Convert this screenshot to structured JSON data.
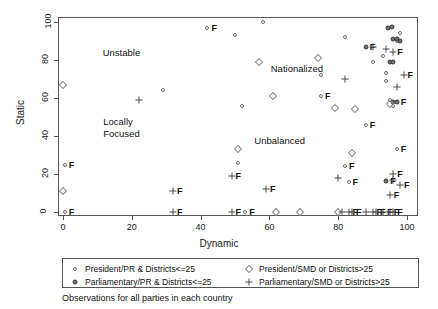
{
  "chart_data": {
    "type": "scatter",
    "title": "",
    "xlabel": "Dynamic",
    "ylabel": "Static",
    "xlim": [
      0,
      100
    ],
    "ylim": [
      0,
      100
    ],
    "xticks": [
      0,
      20,
      40,
      60,
      80,
      100
    ],
    "yticks": [
      0,
      20,
      40,
      60,
      80,
      100
    ],
    "grid": false,
    "caption": "Observations for all parties in each country",
    "legend_position": "below-axes",
    "annotations": [
      {
        "text": "Unstable",
        "x": 17,
        "y": 84
      },
      {
        "text": "Locally\nFocused",
        "x": 17,
        "y": 44
      },
      {
        "text": "Nationalized",
        "x": 68,
        "y": 76
      },
      {
        "text": "Unbalanced",
        "x": 63,
        "y": 38
      }
    ],
    "series": [
      {
        "name": "President/PR &  Districts<=25",
        "marker": "open-circle",
        "points": [
          {
            "x": 0.5,
            "y": 25,
            "label": "F"
          },
          {
            "x": 0.5,
            "y": 0,
            "label": "F"
          },
          {
            "x": 29,
            "y": 64,
            "label": ""
          },
          {
            "x": 42,
            "y": 97,
            "label": "F"
          },
          {
            "x": 50,
            "y": 93,
            "label": ""
          },
          {
            "x": 52,
            "y": 56,
            "label": ""
          },
          {
            "x": 51,
            "y": 26,
            "label": ""
          },
          {
            "x": 53,
            "y": 0,
            "label": "F"
          },
          {
            "x": 58,
            "y": 100,
            "label": ""
          },
          {
            "x": 75,
            "y": 72,
            "label": ""
          },
          {
            "x": 75,
            "y": 61,
            "label": "F"
          },
          {
            "x": 82,
            "y": 92,
            "label": ""
          },
          {
            "x": 82,
            "y": 24,
            "label": "F"
          },
          {
            "x": 83,
            "y": 16,
            "label": "F"
          },
          {
            "x": 88,
            "y": 46,
            "label": "F"
          },
          {
            "x": 90,
            "y": 79,
            "label": ""
          },
          {
            "x": 93,
            "y": 82,
            "label": ""
          },
          {
            "x": 94,
            "y": 73,
            "label": ""
          },
          {
            "x": 94,
            "y": 69,
            "label": ""
          },
          {
            "x": 95,
            "y": 59,
            "label": ""
          },
          {
            "x": 96,
            "y": 56,
            "label": ""
          },
          {
            "x": 97,
            "y": 33,
            "label": "F"
          },
          {
            "x": 98,
            "y": 94,
            "label": ""
          },
          {
            "x": 97,
            "y": 90,
            "label": ""
          }
        ]
      },
      {
        "name": "Parliamentary/PR & Districts<=25",
        "marker": "filled-circle",
        "points": [
          {
            "x": 88,
            "y": 87,
            "label": "F"
          },
          {
            "x": 94.5,
            "y": 97,
            "label": ""
          },
          {
            "x": 95.5,
            "y": 97.5,
            "label": ""
          },
          {
            "x": 96,
            "y": 91,
            "label": ""
          },
          {
            "x": 97,
            "y": 91,
            "label": ""
          },
          {
            "x": 98,
            "y": 90,
            "label": ""
          },
          {
            "x": 95,
            "y": 79,
            "label": ""
          },
          {
            "x": 96,
            "y": 79,
            "label": ""
          },
          {
            "x": 96,
            "y": 58,
            "label": ""
          },
          {
            "x": 97,
            "y": 58,
            "label": "F"
          },
          {
            "x": 94,
            "y": 16.5,
            "label": "F"
          }
        ]
      },
      {
        "name": "President/SMD or Districts>25",
        "marker": "open-diamond",
        "points": [
          {
            "x": 0,
            "y": 67,
            "label": ""
          },
          {
            "x": 0,
            "y": 11,
            "label": ""
          },
          {
            "x": 51,
            "y": 33,
            "label": ""
          },
          {
            "x": 57,
            "y": 79,
            "label": ""
          },
          {
            "x": 61,
            "y": 61,
            "label": ""
          },
          {
            "x": 62,
            "y": 0,
            "label": ""
          },
          {
            "x": 69,
            "y": 0,
            "label": ""
          },
          {
            "x": 74,
            "y": 81,
            "label": ""
          },
          {
            "x": 79,
            "y": 55,
            "label": ""
          },
          {
            "x": 80,
            "y": 0,
            "label": ""
          },
          {
            "x": 85,
            "y": 54,
            "label": ""
          },
          {
            "x": 84,
            "y": 31,
            "label": ""
          },
          {
            "x": 95,
            "y": 57,
            "label": ""
          }
        ]
      },
      {
        "name": "Parliamentary/SMD or Districts>25",
        "marker": "plus",
        "points": [
          {
            "x": 22,
            "y": 59,
            "label": ""
          },
          {
            "x": 32,
            "y": 11,
            "label": "F"
          },
          {
            "x": 32,
            "y": 0,
            "label": "F"
          },
          {
            "x": 49,
            "y": 19,
            "label": "F"
          },
          {
            "x": 49,
            "y": 0,
            "label": "F"
          },
          {
            "x": 59,
            "y": 12,
            "label": "F"
          },
          {
            "x": 80,
            "y": 18,
            "label": ""
          },
          {
            "x": 81,
            "y": 0,
            "label": ""
          },
          {
            "x": 82,
            "y": 70,
            "label": ""
          },
          {
            "x": 83,
            "y": 0,
            "label": "F"
          },
          {
            "x": 84,
            "y": 0,
            "label": "F"
          },
          {
            "x": 88,
            "y": 0,
            "label": ""
          },
          {
            "x": 90,
            "y": 0,
            "label": "F"
          },
          {
            "x": 91,
            "y": 0,
            "label": "F"
          },
          {
            "x": 93,
            "y": 0,
            "label": "F"
          },
          {
            "x": 95,
            "y": 0,
            "label": "F"
          },
          {
            "x": 96,
            "y": 0,
            "label": "F"
          },
          {
            "x": 95,
            "y": 9,
            "label": "F"
          },
          {
            "x": 96,
            "y": 20,
            "label": "F"
          },
          {
            "x": 98,
            "y": 14,
            "label": "F"
          },
          {
            "x": 96,
            "y": 17,
            "label": ""
          },
          {
            "x": 94,
            "y": 86,
            "label": ""
          },
          {
            "x": 96,
            "y": 84,
            "label": "F"
          },
          {
            "x": 97,
            "y": 66,
            "label": ""
          },
          {
            "x": 99,
            "y": 72,
            "label": "F"
          },
          {
            "x": 90,
            "y": 87,
            "label": ""
          }
        ]
      }
    ]
  },
  "legend": {
    "entries": [
      {
        "marker": "open-circle",
        "label": "President/PR &  Districts<=25"
      },
      {
        "marker": "filled-circle",
        "label": "Parliamentary/PR & Districts<=25"
      },
      {
        "marker": "open-diamond",
        "label": "President/SMD or Districts>25"
      },
      {
        "marker": "plus",
        "label": "Parliamentary/SMD or Districts>25"
      }
    ]
  },
  "colors": {
    "frame": "#555555",
    "open_marker": "#6b6b6b",
    "filled_marker": "#6f6f6f",
    "diamond_marker": "#8a8a8a",
    "plus_marker": "#4a4a4a",
    "text": "#111111",
    "background": "#ffffff"
  }
}
